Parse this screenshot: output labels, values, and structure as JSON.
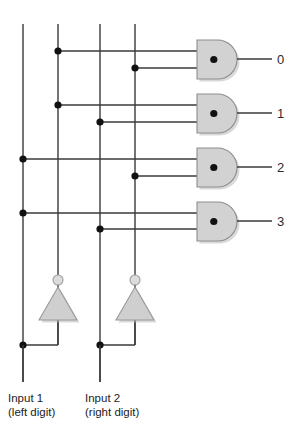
{
  "diagram": {
    "background_color": "#ffffff",
    "wire_color": "#3a3a3a",
    "gate_fill_color": "#d2d2d2",
    "gate_stroke_color": "#8d8d8d",
    "junction_color": "#111111",
    "inverter_fill_color": "#cfcfcf",
    "bubble_fill_color": "#dcdcdc"
  },
  "inputs": [
    {
      "id": "input-1",
      "label_line1": "Input 1",
      "label_line2": "(left digit)",
      "stem_x": 23,
      "inverted_line_x": 58,
      "label_x": 8,
      "label_y": 391
    },
    {
      "id": "input-2",
      "label_line1": "Input 2",
      "label_line2": "(right digit)",
      "stem_x": 100,
      "inverted_line_x": 135,
      "label_x": 85,
      "label_y": 391
    }
  ],
  "bus_lines": [
    {
      "name": "input-1-true-line",
      "x": 23,
      "y_top": 24,
      "y_bottom": 382
    },
    {
      "name": "input-1-complement-line",
      "x": 58,
      "y_top": 24,
      "y_bottom": 345
    },
    {
      "name": "input-2-true-line",
      "x": 100,
      "y_top": 24,
      "y_bottom": 382
    },
    {
      "name": "input-2-complement-line",
      "x": 135,
      "y_top": 24,
      "y_bottom": 345
    }
  ],
  "gates": [
    {
      "name": "and-gate-0",
      "output_label": "0",
      "top_input_source_x": 58,
      "top_input_y": 51,
      "bottom_input_source_x": 135,
      "bottom_input_y": 68,
      "body_x": 197,
      "body_y": 40,
      "body_w": 40,
      "body_h": 39,
      "output_y": 59,
      "output_end_x": 272,
      "label_x": 277,
      "label_y": 53
    },
    {
      "name": "and-gate-1",
      "output_label": "1",
      "top_input_source_x": 58,
      "top_input_y": 105,
      "bottom_input_source_x": 100,
      "bottom_input_y": 122,
      "body_x": 197,
      "body_y": 94,
      "body_w": 40,
      "body_h": 39,
      "output_y": 113,
      "output_end_x": 272,
      "label_x": 277,
      "label_y": 107,
      "label_y_offset": 0
    },
    {
      "name": "and-gate-2",
      "output_label": "2",
      "top_input_source_x": 23,
      "top_input_y": 159,
      "bottom_input_source_x": 135,
      "bottom_input_y": 176,
      "body_x": 197,
      "body_y": 148,
      "body_w": 40,
      "body_h": 39,
      "output_y": 167,
      "output_end_x": 272,
      "label_x": 277,
      "label_y": 161
    },
    {
      "name": "and-gate-3",
      "output_label": "3",
      "top_input_source_x": 23,
      "top_input_y": 213,
      "bottom_input_source_x": 100,
      "bottom_input_y": 229,
      "body_x": 197,
      "body_y": 202,
      "body_w": 40,
      "body_h": 39,
      "output_y": 221,
      "output_end_x": 272,
      "label_x": 277,
      "label_y": 215
    }
  ],
  "inverters": [
    {
      "name": "inverter-1",
      "apex_x": 58,
      "bubble_cy": 280,
      "bubble_r": 5,
      "tri_top_y": 287,
      "tri_bottom_y": 320,
      "tri_half_width": 19,
      "stem_from_x": 23,
      "junction_y": 345
    },
    {
      "name": "inverter-2",
      "apex_x": 135,
      "bubble_cy": 280,
      "bubble_r": 5,
      "tri_top_y": 287,
      "tri_bottom_y": 320,
      "tri_half_width": 19,
      "stem_from_x": 100,
      "junction_y": 345
    }
  ],
  "junction_dots": [
    {
      "name": "junction-g0-top",
      "x": 58,
      "y": 51
    },
    {
      "name": "junction-g0-bottom",
      "x": 135,
      "y": 68
    },
    {
      "name": "junction-g1-top",
      "x": 58,
      "y": 105
    },
    {
      "name": "junction-g1-bottom",
      "x": 100,
      "y": 122
    },
    {
      "name": "junction-g2-top",
      "x": 23,
      "y": 159
    },
    {
      "name": "junction-g2-bottom",
      "x": 135,
      "y": 176
    },
    {
      "name": "junction-g3-top",
      "x": 23,
      "y": 213
    },
    {
      "name": "junction-g3-bottom",
      "x": 100,
      "y": 229
    },
    {
      "name": "junction-inv1-tap",
      "x": 23,
      "y": 345
    },
    {
      "name": "junction-inv2-tap",
      "x": 100,
      "y": 345
    }
  ]
}
